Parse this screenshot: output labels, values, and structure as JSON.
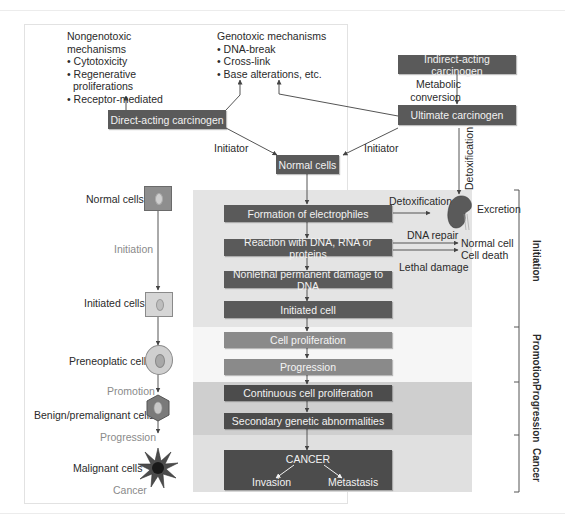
{
  "mechanisms": {
    "nongenotoxic": {
      "title": [
        "Nongenotoxic",
        "mechanisms"
      ],
      "items": [
        "• Cytotoxicity",
        "• Regenerative",
        "  proliferations",
        "• Receptor-mediated"
      ]
    },
    "genotoxic": {
      "title": "Genotoxic mechanisms",
      "items": [
        "• DNA-break",
        "• Cross-link",
        "• Base alterations, etc."
      ]
    }
  },
  "carcinogens": {
    "direct": "Direct-acting carcinogen",
    "indirect": "Indirect-acting carcinogen",
    "ultimate": "Ultimate carcinogen",
    "metabolic_conversion": [
      "Metabolic",
      "conversion"
    ],
    "detoxification_vertical": "Detoxification",
    "initiator_left": "Initiator",
    "initiator_right": "Initiator"
  },
  "main_flow": {
    "normal_cells": "Normal cells",
    "steps": [
      "Formation of electrophiles",
      "Reaction with DNA, RNA or proteins",
      "Nonlethal permanent damage to DNA",
      "Initiated cell",
      "Cell proliferation",
      "Progression",
      "Continuous cell proliferation",
      "Secondary genetic abnormalities"
    ],
    "cancer": {
      "title": "CANCER",
      "outcomes": [
        "Invasion",
        "Metastasis"
      ]
    }
  },
  "side_outcomes": {
    "detoxification": "Detoxification",
    "excretion": "Excretion",
    "dna_repair": "DNA repair",
    "normal_cell": "Normal cell",
    "cell_death": "Cell death",
    "lethal_damage": "Lethal damage"
  },
  "stages": [
    "Initiation",
    "Promotion",
    "Progression",
    "Cancer"
  ],
  "cell_progression": {
    "cells": [
      "Normal cells",
      "Initiated cells",
      "Preneoplatic cells",
      "Benign/premalignant cells",
      "Malignant cells"
    ],
    "transitions": [
      "Initiation",
      "Promotion",
      "Progression",
      "Cancer"
    ]
  },
  "colors": {
    "box_dark": "#5a5a5a",
    "box_mid": "#8a8a8a",
    "initiation_bg": "#e4e4e4",
    "promotion_bg": "#f6f6f6",
    "progression_bg": "#cfcfcf",
    "cancer_bg": "#e0e0e0"
  }
}
